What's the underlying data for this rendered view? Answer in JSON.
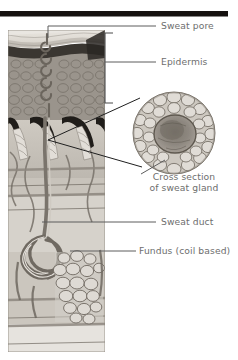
{
  "figure": {
    "background_color": "#ffffff",
    "width": 238,
    "height": 360
  },
  "top_rule": {
    "name": "top-dark-bar",
    "color": "#15110f"
  },
  "labels": [
    {
      "id": "sweat-pore",
      "text": "Sweat pore",
      "x": 161,
      "y": 29,
      "color": "#6e6e6e"
    },
    {
      "id": "epidermis",
      "text": "Epidermis",
      "x": 161,
      "y": 65,
      "color": "#6e6e6e"
    },
    {
      "id": "cross-section-line1",
      "text": "Cross section",
      "x": 184,
      "y": 180,
      "color": "#6e6e6e"
    },
    {
      "id": "cross-section-line2",
      "text": "of sweat gland",
      "x": 184,
      "y": 191,
      "color": "#6e6e6e"
    },
    {
      "id": "sweat-duct",
      "text": "Sweat duct",
      "x": 161,
      "y": 225,
      "color": "#6e6e6e"
    },
    {
      "id": "fundus",
      "text": "Fundus (coil based)",
      "x": 139,
      "y": 254,
      "color": "#6e6e6e"
    }
  ],
  "illustration": {
    "skin_block": {
      "name": "skin-cross-section",
      "x": 8,
      "y": 30,
      "width": 97,
      "height": 322
    },
    "gland_circle": {
      "name": "sweat-gland-cross-section-circle",
      "cx": 174,
      "cy": 133,
      "r": 41
    },
    "layers": [
      "stratum-corneum",
      "stratum-granulosum",
      "stratum-spinosum",
      "dermal-papillae",
      "dermis",
      "subcutaneous-tissue"
    ]
  },
  "colors": {
    "ink_dark": "#1f1f1f",
    "leader_gray": "#5d5d5d",
    "label_gray": "#6e6e6e",
    "tissue_light": "#d8d4cd",
    "tissue_mid": "#a9a49c",
    "tissue_dark": "#6a655e",
    "tissue_deep": "#2e2b27"
  }
}
